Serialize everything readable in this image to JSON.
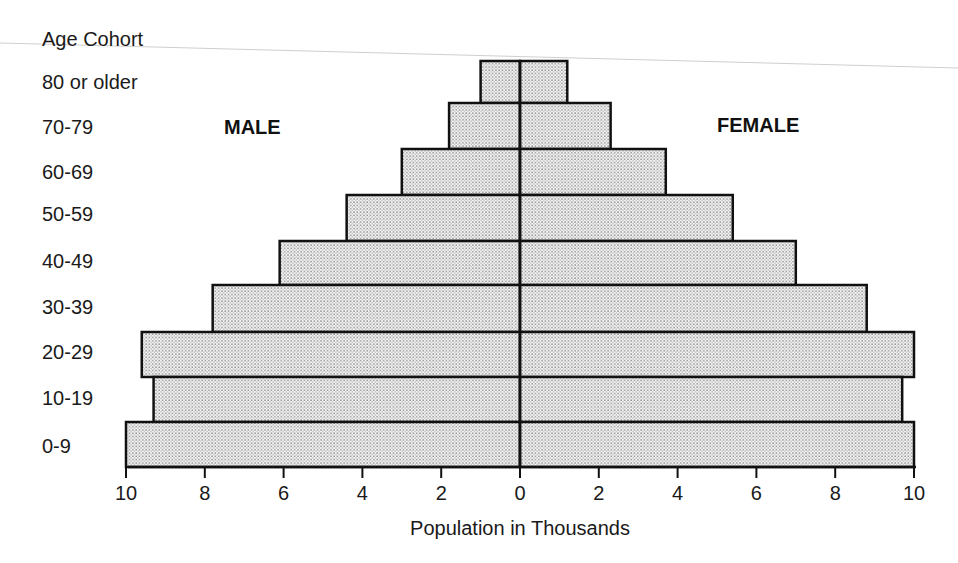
{
  "chart_data": {
    "type": "bar",
    "subtype": "population-pyramid",
    "title": "",
    "category_axis_title": "Age Cohort",
    "xlabel": "Population in Thousands",
    "ylabel": "Age Cohort",
    "categories": [
      "80 or older",
      "70-79",
      "60-69",
      "50-59",
      "40-49",
      "30-39",
      "20-29",
      "10-19",
      "0-9"
    ],
    "series": [
      {
        "name": "MALE",
        "side": "left",
        "values": [
          1.0,
          1.8,
          3.0,
          4.4,
          6.1,
          7.8,
          9.6,
          9.3,
          10.0
        ]
      },
      {
        "name": "FEMALE",
        "side": "right",
        "values": [
          1.2,
          2.3,
          3.7,
          5.4,
          7.0,
          8.8,
          10.0,
          9.7,
          10.0
        ]
      }
    ],
    "xlim": [
      -10,
      10
    ],
    "x_ticks": [
      10,
      8,
      6,
      4,
      2,
      0,
      2,
      4,
      6,
      8,
      10
    ],
    "grid": false,
    "legend": "inline labels (MALE left, FEMALE right)",
    "fill": "dotted stipple pattern, black outline"
  },
  "labels": {
    "category_axis_title": "Age Cohort",
    "x_axis_title": "Population in Thousands",
    "male": "MALE",
    "female": "FEMALE"
  },
  "colors": {
    "outline": "#111111",
    "dot": "#6e6e6e",
    "background": "#ffffff",
    "text": "#1a1a1a"
  }
}
